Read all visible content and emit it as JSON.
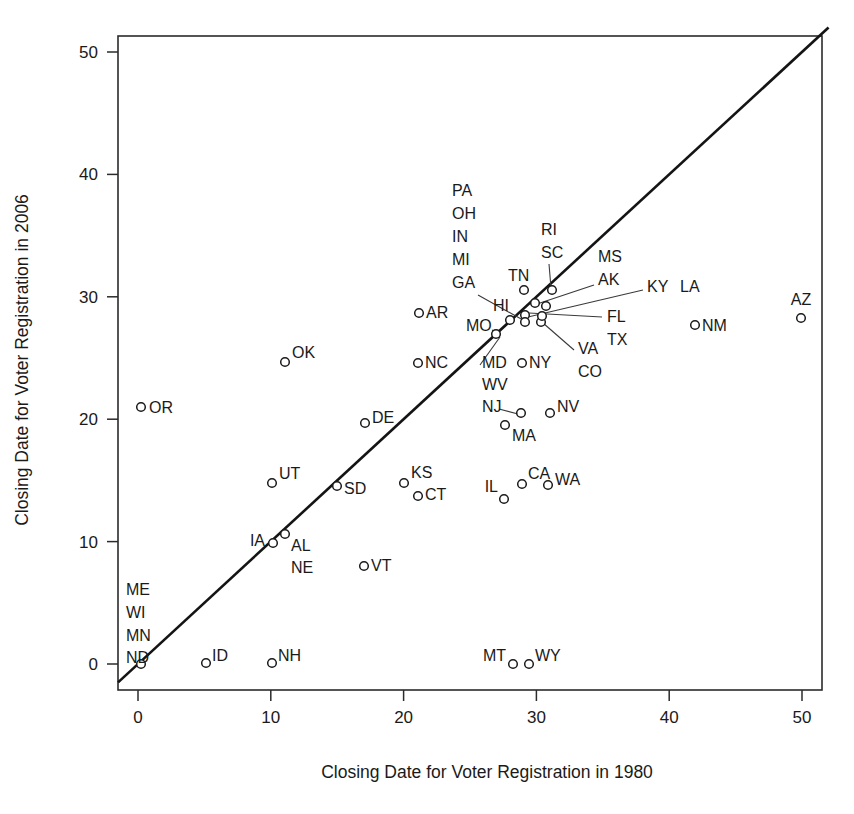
{
  "chart_data": {
    "type": "scatter",
    "title": "",
    "xlabel": "Closing Date for Voter Registration in 1980",
    "ylabel": "Closing Date for Voter Registration in 2006",
    "xlim": [
      -1.5,
      53
    ],
    "ylim": [
      -1.5,
      52
    ],
    "xticks": [
      0,
      10,
      20,
      30,
      40,
      50
    ],
    "yticks": [
      0,
      10,
      20,
      30,
      40,
      50
    ],
    "xtick_labels": [
      "0",
      "10",
      "20",
      "30",
      "40",
      "50"
    ],
    "ytick_labels": [
      "0",
      "10",
      "20",
      "30",
      "40",
      "50"
    ],
    "grid": false,
    "legend": "none",
    "reference_line": {
      "name": "identity-line",
      "description": "y = x diagonal reference line",
      "from": [
        -1.5,
        -1.5
      ],
      "to": [
        52,
        52
      ]
    },
    "points": [
      {
        "label": "ME",
        "x": 0,
        "y": 0,
        "lx": 126,
        "ly": 595,
        "anchor": "start",
        "leader": false
      },
      {
        "label": "WI",
        "x": 0,
        "y": 0,
        "lx": 126,
        "ly": 618,
        "anchor": "start",
        "leader": false
      },
      {
        "label": "MN",
        "x": 0,
        "y": 0,
        "lx": 126,
        "ly": 641,
        "anchor": "start",
        "leader": false
      },
      {
        "label": "ND",
        "x": 0,
        "y": 0,
        "lx": 126,
        "ly": 663,
        "anchor": "start",
        "leader": false
      },
      {
        "label": "OR",
        "x": 0,
        "y": 21,
        "lx": 149,
        "ly": 413,
        "anchor": "start",
        "leader": false
      },
      {
        "label": "ID",
        "x": 5,
        "y": 0,
        "lx": 212,
        "ly": 661,
        "anchor": "start",
        "leader": false
      },
      {
        "label": "NH",
        "x": 10,
        "y": 0,
        "lx": 278,
        "ly": 661,
        "anchor": "start",
        "leader": false
      },
      {
        "label": "UT",
        "x": 10,
        "y": 15,
        "lx": 279,
        "ly": 479,
        "anchor": "start",
        "leader": false
      },
      {
        "label": "IA",
        "x": 10,
        "y": 10,
        "lx": 265,
        "ly": 546,
        "anchor": "end",
        "leader": false
      },
      {
        "label": "AL",
        "x": 11,
        "y": 10.5,
        "lx": 291,
        "ly": 551,
        "anchor": "start",
        "leader": false
      },
      {
        "label": "NE",
        "x": 11,
        "y": 10.5,
        "lx": 291,
        "ly": 573,
        "anchor": "start",
        "leader": false
      },
      {
        "label": "OK",
        "x": 11,
        "y": 25,
        "lx": 292,
        "ly": 358,
        "anchor": "start",
        "leader": false
      },
      {
        "label": "SD",
        "x": 15,
        "y": 15,
        "lx": 344,
        "ly": 494,
        "anchor": "start",
        "leader": false
      },
      {
        "label": "DE",
        "x": 17,
        "y": 20,
        "lx": 372,
        "ly": 423,
        "anchor": "start",
        "leader": false
      },
      {
        "label": "VT",
        "x": 17,
        "y": 8,
        "lx": 371,
        "ly": 571,
        "anchor": "start",
        "leader": false
      },
      {
        "label": "KS",
        "x": 20,
        "y": 15,
        "lx": 411,
        "ly": 478,
        "anchor": "start",
        "leader": false
      },
      {
        "label": "CT",
        "x": 21,
        "y": 14,
        "lx": 425,
        "ly": 500,
        "anchor": "start",
        "leader": false
      },
      {
        "label": "AR",
        "x": 21,
        "y": 28.5,
        "lx": 426,
        "ly": 318,
        "anchor": "start",
        "leader": false
      },
      {
        "label": "NC",
        "x": 21,
        "y": 25,
        "lx": 425,
        "ly": 368,
        "anchor": "start",
        "leader": false
      },
      {
        "label": "IL",
        "x": 27.5,
        "y": 13.7,
        "lx": 498,
        "ly": 492,
        "anchor": "end",
        "leader": false
      },
      {
        "label": "MT",
        "x": 28,
        "y": 0,
        "lx": 506,
        "ly": 661,
        "anchor": "end",
        "leader": false
      },
      {
        "label": "WY",
        "x": 29.5,
        "y": 0,
        "lx": 535,
        "ly": 661,
        "anchor": "start",
        "leader": false
      },
      {
        "label": "CA",
        "x": 29,
        "y": 15,
        "lx": 528,
        "ly": 479,
        "anchor": "start",
        "leader": false
      },
      {
        "label": "WA",
        "x": 31,
        "y": 15,
        "lx": 555,
        "ly": 485,
        "anchor": "start",
        "leader": false
      },
      {
        "label": "MA",
        "x": 28,
        "y": 19,
        "lx": 512,
        "ly": 441,
        "anchor": "start",
        "leader": false
      },
      {
        "label": "NV",
        "x": 31,
        "y": 20.7,
        "lx": 557,
        "ly": 412,
        "anchor": "start",
        "leader": false
      },
      {
        "label": "NY",
        "x": 28.5,
        "y": 24.7,
        "lx": 529,
        "ly": 368,
        "anchor": "start",
        "leader": false
      },
      {
        "label": "MD",
        "x": 29,
        "y": 20.7,
        "lx": 482,
        "ly": 368,
        "anchor": "start",
        "leader": true
      },
      {
        "label": "WV",
        "x": 29,
        "y": 20.7,
        "lx": 482,
        "ly": 390,
        "anchor": "start",
        "leader": false
      },
      {
        "label": "NJ",
        "x": 29,
        "y": 20.7,
        "lx": 482,
        "ly": 412,
        "anchor": "start",
        "leader": true
      },
      {
        "label": "MO",
        "x": 26,
        "y": 27,
        "lx": 466,
        "ly": 331,
        "anchor": "start",
        "leader": true
      },
      {
        "label": "HI",
        "x": 27.5,
        "y": 29.3,
        "lx": 493,
        "ly": 311,
        "anchor": "start",
        "leader": false
      },
      {
        "label": "TN",
        "x": 28.5,
        "y": 31.2,
        "lx": 508,
        "ly": 281,
        "anchor": "start",
        "leader": false
      },
      {
        "label": "PA",
        "x": 29,
        "y": 29.8,
        "lx": 452,
        "ly": 196,
        "anchor": "start",
        "leader": false
      },
      {
        "label": "OH",
        "x": 29,
        "y": 29.8,
        "lx": 452,
        "ly": 219,
        "anchor": "start",
        "leader": false
      },
      {
        "label": "IN",
        "x": 29,
        "y": 29.8,
        "lx": 452,
        "ly": 242,
        "anchor": "start",
        "leader": false
      },
      {
        "label": "MI",
        "x": 29,
        "y": 29.8,
        "lx": 452,
        "ly": 265,
        "anchor": "start",
        "leader": false
      },
      {
        "label": "GA",
        "x": 29,
        "y": 29.8,
        "lx": 452,
        "ly": 288,
        "anchor": "start",
        "leader": true
      },
      {
        "label": "RI",
        "x": 31.2,
        "y": 31.2,
        "lx": 541,
        "ly": 235,
        "anchor": "start",
        "leader": false
      },
      {
        "label": "SC",
        "x": 31.2,
        "y": 31.2,
        "lx": 541,
        "ly": 258,
        "anchor": "start",
        "leader": true
      },
      {
        "label": "MS",
        "x": 30.5,
        "y": 29.5,
        "lx": 598,
        "ly": 262,
        "anchor": "start",
        "leader": false
      },
      {
        "label": "AK",
        "x": 30.5,
        "y": 29.5,
        "lx": 598,
        "ly": 285,
        "anchor": "start",
        "leader": true
      },
      {
        "label": "KY",
        "x": 31,
        "y": 28.9,
        "lx": 647,
        "ly": 292,
        "anchor": "start",
        "leader": true
      },
      {
        "label": "LA",
        "x": 31,
        "y": 28.9,
        "lx": 680,
        "ly": 292,
        "anchor": "start",
        "leader": false
      },
      {
        "label": "FL",
        "x": 30,
        "y": 28.5,
        "lx": 607,
        "ly": 322,
        "anchor": "start",
        "leader": true
      },
      {
        "label": "TX",
        "x": 30,
        "y": 28.5,
        "lx": 607,
        "ly": 345,
        "anchor": "start",
        "leader": false
      },
      {
        "label": "VA",
        "x": 30,
        "y": 28.3,
        "lx": 578,
        "ly": 354,
        "anchor": "start",
        "leader": true
      },
      {
        "label": "CO",
        "x": 30,
        "y": 28.3,
        "lx": 578,
        "ly": 377,
        "anchor": "start",
        "leader": false
      },
      {
        "label": "NM",
        "x": 42,
        "y": 27.5,
        "lx": 702,
        "ly": 331,
        "anchor": "start",
        "leader": false
      },
      {
        "label": "AZ",
        "x": 50,
        "y": 28.5,
        "lx": 801,
        "ly": 305,
        "anchor": "middle",
        "leader": false
      }
    ],
    "markers": [
      {
        "name": "ND",
        "px": 141,
        "py": 664
      },
      {
        "name": "OR",
        "px": 141,
        "py": 407
      },
      {
        "name": "ID",
        "px": 206,
        "py": 663
      },
      {
        "name": "NH",
        "px": 272,
        "py": 663
      },
      {
        "name": "UT",
        "px": 272,
        "py": 483
      },
      {
        "name": "IA",
        "px": 273,
        "py": 543
      },
      {
        "name": "AL",
        "px": 285,
        "py": 534
      },
      {
        "name": "OK",
        "px": 285,
        "py": 362
      },
      {
        "name": "SD",
        "px": 337,
        "py": 486
      },
      {
        "name": "DE",
        "px": 365,
        "py": 423
      },
      {
        "name": "VT",
        "px": 364,
        "py": 566
      },
      {
        "name": "KS",
        "px": 404,
        "py": 483
      },
      {
        "name": "CT",
        "px": 418,
        "py": 496
      },
      {
        "name": "AR",
        "px": 419,
        "py": 313
      },
      {
        "name": "NC",
        "px": 418,
        "py": 363
      },
      {
        "name": "IL",
        "px": 504,
        "py": 499
      },
      {
        "name": "MT",
        "px": 513,
        "py": 664
      },
      {
        "name": "WY",
        "px": 529,
        "py": 664
      },
      {
        "name": "CA",
        "px": 522,
        "py": 484
      },
      {
        "name": "WA",
        "px": 548,
        "py": 485
      },
      {
        "name": "MA",
        "px": 505,
        "py": 425
      },
      {
        "name": "NV",
        "px": 550,
        "py": 413
      },
      {
        "name": "NY",
        "px": 522,
        "py": 363
      },
      {
        "name": "NJ-MD-WV",
        "px": 521,
        "py": 413
      },
      {
        "name": "MO",
        "px": 496,
        "py": 334
      },
      {
        "name": "HI",
        "px": 510,
        "py": 320
      },
      {
        "name": "TN",
        "px": 524,
        "py": 290
      },
      {
        "name": "core-1",
        "px": 525,
        "py": 315
      },
      {
        "name": "core-2",
        "px": 525,
        "py": 322
      },
      {
        "name": "core-3",
        "px": 535,
        "py": 303
      },
      {
        "name": "core-4",
        "px": 541,
        "py": 322
      },
      {
        "name": "core-5",
        "px": 542,
        "py": 316
      },
      {
        "name": "core-6",
        "px": 546,
        "py": 306
      },
      {
        "name": "core-7",
        "px": 552,
        "py": 290
      },
      {
        "name": "NM",
        "px": 695,
        "py": 325
      },
      {
        "name": "AZ",
        "px": 801,
        "py": 318
      }
    ],
    "leaders": [
      {
        "name": "ga-leader",
        "x1": 478,
        "y1": 295,
        "x2": 523,
        "y2": 320
      },
      {
        "name": "mo-leader",
        "x1": 492,
        "y1": 330,
        "x2": 498,
        "y2": 333
      },
      {
        "name": "md-leader",
        "x1": 480,
        "y1": 365,
        "x2": 500,
        "y2": 337
      },
      {
        "name": "nj-leader",
        "x1": 499,
        "y1": 409,
        "x2": 518,
        "y2": 414
      },
      {
        "name": "sc-leader",
        "x1": 549,
        "y1": 264,
        "x2": 551,
        "y2": 288
      },
      {
        "name": "ak-leader",
        "x1": 594,
        "y1": 285,
        "x2": 537,
        "y2": 304
      },
      {
        "name": "ky-leader",
        "x1": 643,
        "y1": 290,
        "x2": 528,
        "y2": 317
      },
      {
        "name": "fl-leader",
        "x1": 602,
        "y1": 317,
        "x2": 529,
        "y2": 313
      },
      {
        "name": "va-leader",
        "x1": 574,
        "y1": 350,
        "x2": 543,
        "y2": 323
      }
    ]
  },
  "axes": {
    "x_title": "Closing Date for Voter Registration in 1980",
    "y_title": "Closing Date for Voter Registration in 2006"
  }
}
